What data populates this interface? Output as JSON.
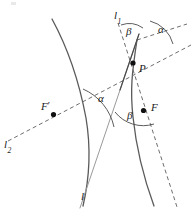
{
  "figure": {
    "width": 194,
    "height": 218,
    "background": "#ffffff"
  },
  "colors": {
    "curve": "#5a5a5a",
    "dashed": "#6e6e6e",
    "tangent": "#9a9a9a",
    "arc": "#4a4a4a",
    "label": "#1a1a1a",
    "dot": "#101010"
  },
  "labels": {
    "line_l1": "l",
    "line_l1_sub": "1",
    "line_l2": "l",
    "line_l2_sub": "2",
    "line_l": "l",
    "point_P": "P",
    "focus_F": "F",
    "focus_F_prime": "F",
    "focus_F_prime_mark": "′",
    "angle_alpha_top": "α",
    "angle_alpha_mid": "α",
    "angle_beta_top": "β",
    "angle_beta_low": "β"
  },
  "geometry": {
    "point_P": {
      "x": 133,
      "y": 63
    },
    "focus_F": {
      "x": 143.5,
      "y": 110
    },
    "focus_F_prime": {
      "x": 53.5,
      "y": 114.5
    },
    "left_branch": "M 52,19 C 70,52 80,86 86,118 C 91,148 90,176 83,206",
    "right_branch": "M 154,206 C 143,176 136,146 133,117 C 130,90 132,72 137,40",
    "dashed_l2": "M 8,140 L 190,45",
    "dashed_l1_through_P": "M 118,22 L 176,206",
    "dashed_top_right": "M 137,40 L 186,24",
    "tangent_line": "M 137,40 L 82,206",
    "arc_beta_top": "M 125,24 A 26,26 0 0 1 145,27",
    "arc_alpha_top": "M 150,24 A 30,30 0 0 1 171,43",
    "arc_alpha_mid": "M 84,88 A 56,56 0 0 1 117,125",
    "arc_beta_low": "M 120,108 A 38,38 0 0 0 157,121"
  },
  "label_positions": {
    "l1": {
      "x": 115,
      "y": 11
    },
    "l2": {
      "x": 5,
      "y": 140
    },
    "l": {
      "x": 81,
      "y": 192
    },
    "P": {
      "x": 140,
      "y": 62
    },
    "F": {
      "x": 152,
      "y": 102
    },
    "F_prime": {
      "x": 42,
      "y": 102
    },
    "alpha_top": {
      "x": 159,
      "y": 24
    },
    "alpha_mid": {
      "x": 99,
      "y": 94
    },
    "beta_top": {
      "x": 128,
      "y": 26
    },
    "beta_low": {
      "x": 128,
      "y": 110
    }
  }
}
